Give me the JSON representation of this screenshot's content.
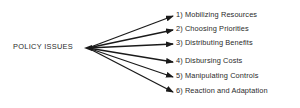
{
  "diagram": {
    "root": {
      "label": "POLICY ISSUES"
    },
    "items": [
      {
        "label": "1) Mobilizing Resources",
        "y": 16
      },
      {
        "label": "2) Choosing Priorities",
        "y": 30
      },
      {
        "label": "3) Distributing Benefits",
        "y": 44
      },
      {
        "label": "4) Disbursing Costs",
        "y": 62
      },
      {
        "label": "5) Manipulating Controls",
        "y": 77
      },
      {
        "label": "6) Reaction and Adaptation",
        "y": 92
      }
    ],
    "colors": {
      "line": "#1a1a1a",
      "text": "#2a2a2a",
      "background": "#ffffff"
    }
  }
}
